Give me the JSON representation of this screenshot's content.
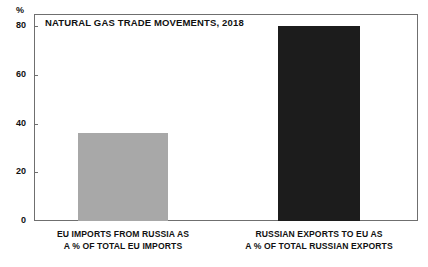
{
  "chart_data": {
    "type": "bar",
    "title": "NATURAL GAS TRADE MOVEMENTS, 2018",
    "xlabel": "",
    "ylabel": "%",
    "unit_label": "%",
    "categories": [
      "EU IMPORTS FROM RUSSIA AS A % OF TOTAL EU IMPORTS",
      "RUSSIAN EXPORTS TO EU AS A % OF TOTAL RUSSIAN EXPORTS"
    ],
    "category_lines": [
      [
        "EU IMPORTS FROM RUSSIA AS",
        "A % OF TOTAL EU IMPORTS"
      ],
      [
        "RUSSIAN EXPORTS TO EU AS",
        "A % OF TOTAL RUSSIAN EXPORTS"
      ]
    ],
    "values": [
      36,
      80
    ],
    "bar_colors": [
      "#a8a8a8",
      "#1c1c1c"
    ],
    "ylim": [
      0,
      85
    ],
    "yticks": [
      0,
      20,
      40,
      60,
      80
    ],
    "ytick_labels": [
      "0",
      "20",
      "40",
      "60",
      "80"
    ],
    "grid": false,
    "legend": "none"
  },
  "axis": {
    "unit": "%",
    "ticks": [
      {
        "label": "80",
        "value": 80
      },
      {
        "label": "60",
        "value": 60
      },
      {
        "label": "40",
        "value": 40
      },
      {
        "label": "20",
        "value": 20
      },
      {
        "label": "0",
        "value": 0
      }
    ]
  },
  "bars": [
    {
      "label_line1": "EU IMPORTS FROM RUSSIA AS",
      "label_line2": "A % OF TOTAL EU IMPORTS",
      "value": 36,
      "color": "#a8a8a8"
    },
    {
      "label_line1": "RUSSIAN EXPORTS TO EU AS",
      "label_line2": "A % OF TOTAL RUSSIAN EXPORTS",
      "value": 80,
      "color": "#1c1c1c"
    }
  ],
  "title": "NATURAL GAS TRADE MOVEMENTS, 2018"
}
